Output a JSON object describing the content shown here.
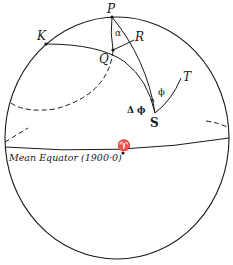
{
  "diagram": {
    "type": "celestial-sphere",
    "points": {
      "P": "P",
      "K": "K",
      "Q": "Q",
      "R": "R",
      "S": "S",
      "T": "T"
    },
    "angles": {
      "alpha": "α",
      "phi": "ϕ",
      "delta_phi": "Δ ϕ"
    },
    "equator_label": "Mean Equator (1900·0)",
    "vernal_equinox_symbol": "♈",
    "colors": {
      "line": "#1a1a1a",
      "background": "#ffffff"
    }
  }
}
